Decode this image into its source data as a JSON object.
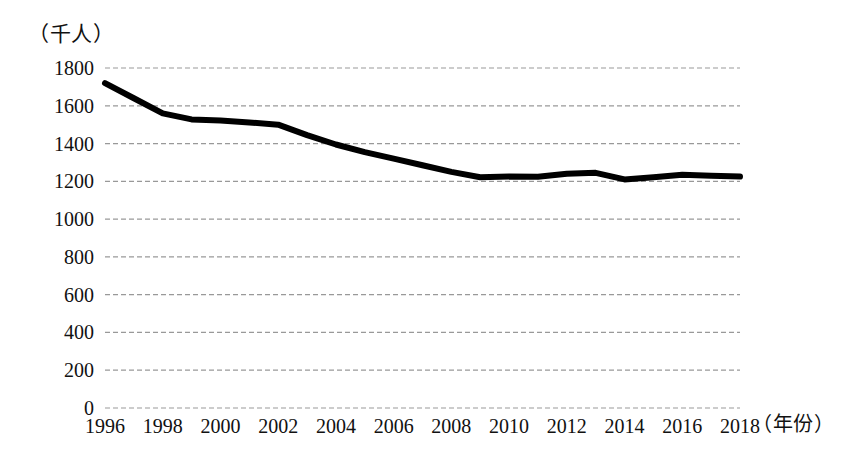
{
  "chart_data": {
    "type": "line",
    "title": "",
    "subtitle": "",
    "xlabel": "（年份）",
    "ylabel": "（千人）",
    "unit_label": "（千人）",
    "xlim": [
      1996,
      2018
    ],
    "ylim": [
      0,
      1800
    ],
    "grid": true,
    "grid_style": "dashed-horizontal",
    "legend": false,
    "legend_position": "none",
    "line_color": "#000000",
    "line_width_px": 6,
    "background_color": "#ffffff",
    "grid_color": "#999999",
    "ytick_labels": [
      "1800",
      "1600",
      "1400",
      "1200",
      "1000",
      "800",
      "600",
      "400",
      "200",
      "0"
    ],
    "ytick_values": [
      1800,
      1600,
      1400,
      1200,
      1000,
      800,
      600,
      400,
      200,
      0
    ],
    "xtick_labels": [
      "1996",
      "1998",
      "2000",
      "2002",
      "2004",
      "2006",
      "2008",
      "2010",
      "2012",
      "2014",
      "2016",
      "2018"
    ],
    "xtick_values": [
      1996,
      1998,
      2000,
      2002,
      2004,
      2006,
      2008,
      2010,
      2012,
      2014,
      2016,
      2018
    ],
    "x": [
      1996,
      1997,
      1998,
      1999,
      2000,
      2001,
      2002,
      2003,
      2004,
      2005,
      2006,
      2007,
      2008,
      2009,
      2010,
      2011,
      2012,
      2013,
      2014,
      2015,
      2016,
      2017,
      2018
    ],
    "values": [
      1720,
      1640,
      1560,
      1528,
      1522,
      1512,
      1500,
      1445,
      1395,
      1355,
      1320,
      1285,
      1250,
      1222,
      1225,
      1224,
      1240,
      1245,
      1210,
      1222,
      1235,
      1230,
      1225
    ],
    "series": [
      {
        "name": "",
        "values": [
          1720,
          1640,
          1560,
          1528,
          1522,
          1512,
          1500,
          1445,
          1395,
          1355,
          1320,
          1285,
          1250,
          1222,
          1225,
          1224,
          1240,
          1245,
          1210,
          1222,
          1235,
          1230,
          1225
        ]
      }
    ],
    "annotations": []
  }
}
